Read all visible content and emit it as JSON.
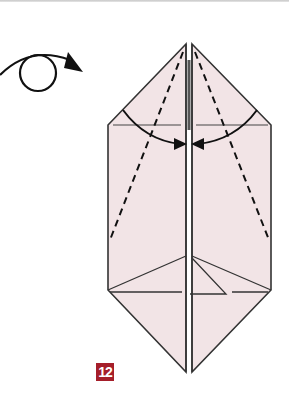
{
  "diagram": {
    "step_number": "12",
    "symbols": {
      "turn_over": "turn-over-arrow"
    },
    "colors": {
      "paper_fill": "#f2e4e6",
      "line": "#222222",
      "badge": "#a51e2a"
    }
  }
}
